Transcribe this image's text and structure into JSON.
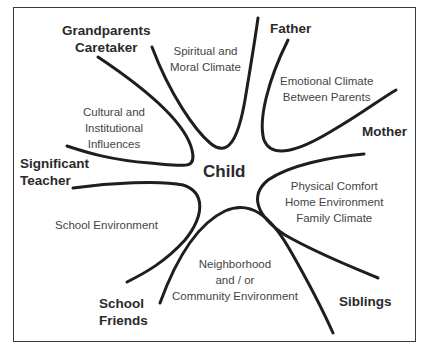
{
  "diagram": {
    "center": "Child",
    "people": {
      "grandparents": [
        "Grandparents",
        "Caretaker"
      ],
      "father": [
        "Father"
      ],
      "mother": [
        "Mother"
      ],
      "teacher": [
        "Significant",
        "Teacher"
      ],
      "friends": [
        "School",
        "Friends"
      ],
      "siblings": [
        "Siblings"
      ]
    },
    "climates": {
      "spiritual": [
        "Spiritual and",
        "Moral Climate"
      ],
      "emotional": [
        "Emotional Climate",
        "Between Parents"
      ],
      "cultural": [
        "Cultural and",
        "Institutional",
        "Influences"
      ],
      "physical": [
        "Physical Comfort",
        "Home Environment",
        "Family Climate"
      ],
      "school": [
        "School Environment"
      ],
      "neighborhood": [
        "Neighborhood",
        "and / or",
        "Community Environment"
      ]
    },
    "colors": {
      "line": "#1e1e1e",
      "frame": "#3a3a3a",
      "text": "#444444"
    }
  }
}
